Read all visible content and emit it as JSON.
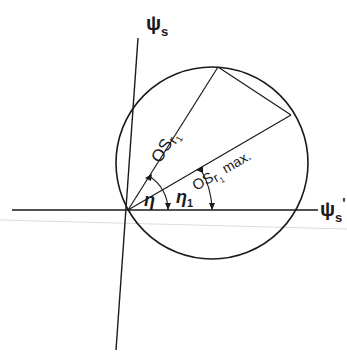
{
  "diagram": {
    "axes": {
      "vertical_label": "ψ",
      "vertical_subscript": "s",
      "horizontal_label": "ψ",
      "horizontal_subscript": "s",
      "horizontal_prime": "'"
    },
    "vectors": [
      {
        "label_main": "OS",
        "label_sub": "r",
        "label_subsub": "1",
        "label_suffix": ""
      },
      {
        "label_main": "OS",
        "label_sub": "r",
        "label_subsub": "1",
        "label_suffix": " max."
      }
    ],
    "angles": [
      {
        "symbol": "η",
        "subscript": ""
      },
      {
        "symbol": "η",
        "subscript": "1"
      }
    ],
    "colors": {
      "line": "#1a1a1a",
      "faint_line": "#d9d9d9",
      "background": "#ffffff"
    }
  }
}
